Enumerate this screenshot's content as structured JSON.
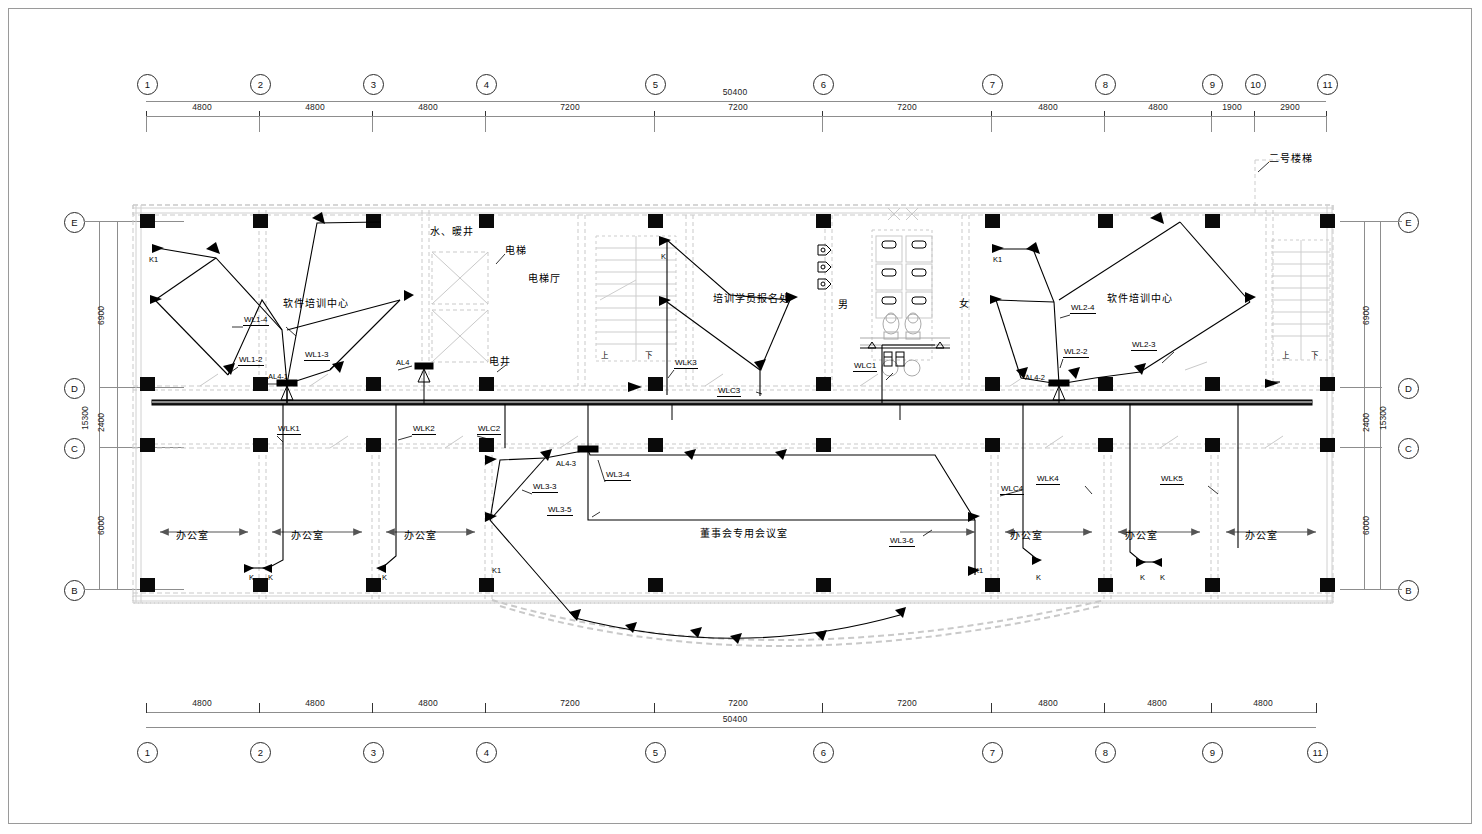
{
  "drawing": {
    "type": "electrical-lighting-floor-plan",
    "title_top_total": "50400",
    "title_bottom_total": "50400",
    "vertical_total": "15300"
  },
  "grid": {
    "top_bubbles": [
      "1",
      "2",
      "3",
      "4",
      "5",
      "6",
      "7",
      "8",
      "9",
      "10",
      "11"
    ],
    "bottom_bubbles": [
      "1",
      "2",
      "3",
      "4",
      "5",
      "6",
      "7",
      "8",
      "9",
      "11"
    ],
    "left_bubbles": [
      "E",
      "D",
      "C",
      "B"
    ],
    "right_bubbles": [
      "E",
      "D",
      "C",
      "B"
    ],
    "top_dims": [
      "4800",
      "4800",
      "4800",
      "7200",
      "7200",
      "7200",
      "4800",
      "4800",
      "1900",
      "2900"
    ],
    "bottom_dims": [
      "4800",
      "4800",
      "4800",
      "7200",
      "7200",
      "7200",
      "4800",
      "4800",
      "4800"
    ],
    "left_dims": [
      "6900",
      "2400",
      "6000"
    ],
    "left_total": "15300",
    "right_dims": [
      "6900",
      "2400",
      "6000"
    ],
    "right_total": "15300",
    "top_overall": "50400",
    "bottom_overall": "50400"
  },
  "rooms": [
    {
      "name": "software-training-center-left",
      "label": "软件培训中心"
    },
    {
      "name": "water-heating-shaft",
      "label": "水、暖井"
    },
    {
      "name": "elevator",
      "label": "电梯"
    },
    {
      "name": "elevator-lobby",
      "label": "电梯厅"
    },
    {
      "name": "electrical-shaft",
      "label": "电井"
    },
    {
      "name": "training-registration",
      "label": "培训学员报名处"
    },
    {
      "name": "toilet-male",
      "label": "男"
    },
    {
      "name": "toilet-female",
      "label": "女"
    },
    {
      "name": "software-training-center-right",
      "label": "软件培训中心"
    },
    {
      "name": "stair-no-2",
      "label": "二号楼梯"
    },
    {
      "name": "office-1",
      "label": "办公室"
    },
    {
      "name": "office-2",
      "label": "办公室"
    },
    {
      "name": "office-3",
      "label": "办公室"
    },
    {
      "name": "board-meeting-room",
      "label": "董事会专用会议室"
    },
    {
      "name": "office-4",
      "label": "办公室"
    },
    {
      "name": "office-5",
      "label": "办公室"
    },
    {
      "name": "office-6",
      "label": "办公室"
    }
  ],
  "stairs": {
    "up": "上",
    "down": "下"
  },
  "circuit_tags": {
    "wl1_4": "WL1-4",
    "wl1_2": "WL1-2",
    "wl1_3": "WL1-3",
    "wl2_4": "WL2-4",
    "wl2_2": "WL2-2",
    "wl2_3": "WL2-3",
    "wl3_3": "WL3-3",
    "wl3_4": "WL3-4",
    "wl3_5": "WL3-5",
    "wl3_6": "WL3-6",
    "wlk1": "WLK1",
    "wlk2": "WLK2",
    "wlk3": "WLK3",
    "wlk4": "WLK4",
    "wlk5": "WLK5",
    "wlc1": "WLC1",
    "wlc2": "WLC2",
    "wlc3": "WLC3",
    "wlc4": "WLC4"
  },
  "panels": {
    "al4": "AL4",
    "al4_1": "AL4-1",
    "al4_2": "AL4-2",
    "al4_3": "AL4-3"
  },
  "switches": {
    "k": "K",
    "k1": "K1"
  },
  "colors": {
    "ink": "#000000",
    "architecture_grey": "#c3c3c3",
    "frame": "#9a9a9a"
  }
}
